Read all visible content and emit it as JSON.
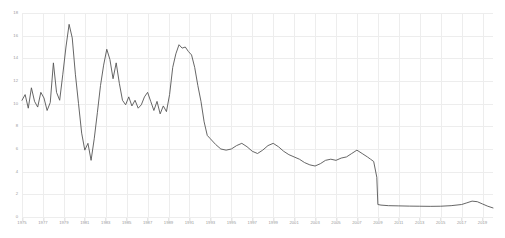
{
  "chart_data": {
    "type": "line",
    "title": "",
    "subtitle": "",
    "xlabel": "",
    "ylabel": "",
    "xlim": [
      1975,
      2020
    ],
    "ylim": [
      0,
      18
    ],
    "grid": true,
    "legend": false,
    "legend_position": "none",
    "line_color": "#555555",
    "grid_color": "#ededed",
    "tick_label_color": "#9a9a9a",
    "background_color": "#ffffff",
    "y_ticks": [
      0,
      2,
      4,
      6,
      8,
      10,
      12,
      14,
      16,
      18
    ],
    "y_tick_labels": [
      "0",
      "2",
      "4",
      "6",
      "8",
      "10",
      "12",
      "14",
      "16",
      "18"
    ],
    "x_ticks": [
      1975,
      1977,
      1979,
      1981,
      1983,
      1985,
      1987,
      1989,
      1991,
      1993,
      1995,
      1997,
      1999,
      2001,
      2003,
      2005,
      2007,
      2009,
      2011,
      2013,
      2015,
      2017,
      2019
    ],
    "x_tick_labels": [
      "1975",
      "1977",
      "1979",
      "1981",
      "1983",
      "1985",
      "1987",
      "1989",
      "1991",
      "1993",
      "1995",
      "1997",
      "1999",
      "2001",
      "2003",
      "2005",
      "2007",
      "2009",
      "2011",
      "2013",
      "2015",
      "2017",
      "2019"
    ],
    "series": [
      {
        "name": "value",
        "x": [
          1975.0,
          1975.3,
          1975.6,
          1975.9,
          1976.2,
          1976.5,
          1976.8,
          1977.1,
          1977.4,
          1977.7,
          1978.0,
          1978.3,
          1978.6,
          1978.9,
          1979.2,
          1979.5,
          1979.8,
          1980.1,
          1980.4,
          1980.7,
          1981.0,
          1981.3,
          1981.6,
          1981.9,
          1982.2,
          1982.5,
          1982.8,
          1983.1,
          1983.4,
          1983.7,
          1984.0,
          1984.3,
          1984.6,
          1984.9,
          1985.2,
          1985.5,
          1985.8,
          1986.1,
          1986.4,
          1986.7,
          1987.0,
          1987.3,
          1987.6,
          1987.9,
          1988.2,
          1988.5,
          1988.8,
          1989.1,
          1989.4,
          1989.7,
          1990.0,
          1990.3,
          1990.6,
          1990.9,
          1991.2,
          1991.5,
          1991.8,
          1992.1,
          1992.4,
          1992.7,
          1993.0,
          1993.5,
          1994.0,
          1994.5,
          1995.0,
          1995.5,
          1996.0,
          1996.5,
          1997.0,
          1997.5,
          1998.0,
          1998.5,
          1999.0,
          1999.5,
          2000.0,
          2000.5,
          2001.0,
          2001.5,
          2002.0,
          2002.5,
          2003.0,
          2003.5,
          2004.0,
          2004.5,
          2005.0,
          2005.5,
          2006.0,
          2006.5,
          2007.0,
          2007.5,
          2008.0,
          2008.3,
          2008.6,
          2008.9,
          2009.0,
          2009.3,
          2010.0,
          2011.0,
          2012.0,
          2013.0,
          2014.0,
          2015.0,
          2016.0,
          2017.0,
          2017.5,
          2018.0,
          2018.5,
          2019.0,
          2019.5,
          2020.0
        ],
        "y": [
          10.3,
          10.8,
          9.6,
          11.4,
          10.2,
          9.7,
          11.0,
          10.5,
          9.4,
          10.1,
          13.6,
          11.0,
          10.3,
          12.6,
          15.0,
          17.0,
          15.8,
          12.6,
          10.0,
          7.4,
          5.9,
          6.5,
          5.0,
          6.9,
          9.2,
          11.6,
          13.4,
          14.8,
          13.9,
          12.2,
          13.6,
          11.8,
          10.3,
          9.9,
          10.6,
          9.8,
          10.3,
          9.6,
          9.9,
          10.6,
          11.0,
          10.2,
          9.4,
          10.2,
          9.1,
          9.8,
          9.3,
          10.8,
          13.2,
          14.4,
          15.2,
          14.9,
          15.0,
          14.6,
          14.3,
          13.2,
          11.6,
          10.2,
          8.4,
          7.2,
          6.9,
          6.4,
          6.0,
          5.9,
          6.0,
          6.3,
          6.5,
          6.2,
          5.8,
          5.6,
          5.9,
          6.3,
          6.5,
          6.2,
          5.8,
          5.5,
          5.3,
          5.1,
          4.8,
          4.6,
          4.5,
          4.7,
          5.0,
          5.1,
          5.0,
          5.2,
          5.3,
          5.6,
          5.9,
          5.6,
          5.3,
          5.1,
          4.9,
          3.5,
          1.1,
          1.05,
          1.0,
          0.98,
          0.96,
          0.95,
          0.94,
          0.95,
          1.0,
          1.1,
          1.25,
          1.4,
          1.35,
          1.15,
          0.95,
          0.8
        ]
      }
    ]
  }
}
